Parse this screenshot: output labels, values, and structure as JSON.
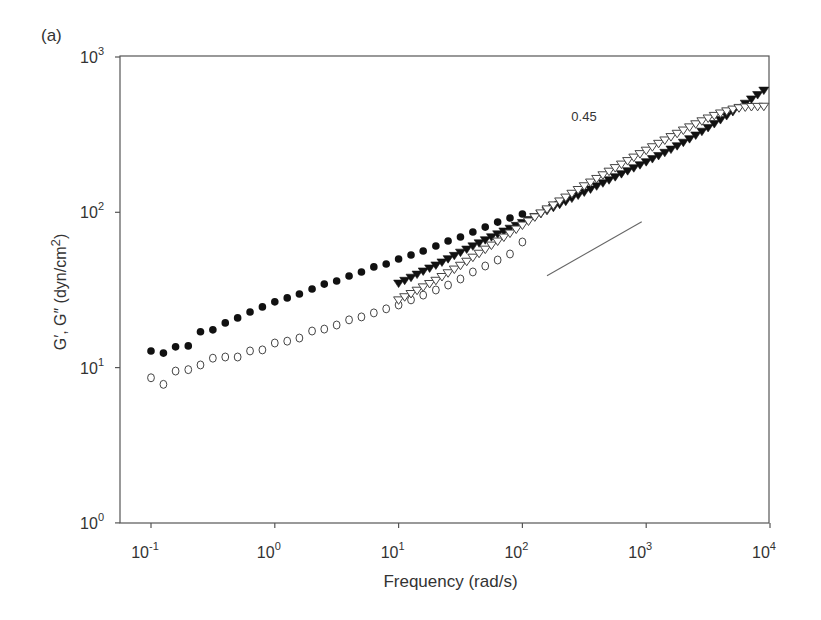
{
  "panel_label": "(a)",
  "chart_data": {
    "type": "scatter",
    "title": "",
    "panel": "(a)",
    "xlabel": "Frequency (rad/s)",
    "ylabel": "G′, G″ (dyn/cm2)",
    "xscale": "log",
    "yscale": "log",
    "xlim": [
      0.05,
      10000
    ],
    "ylim": [
      1,
      1000
    ],
    "grid": false,
    "legend": null,
    "x_ticks": [
      {
        "value": 0.1,
        "base": "10",
        "exp": "-1"
      },
      {
        "value": 1,
        "base": "10",
        "exp": "0"
      },
      {
        "value": 10,
        "base": "10",
        "exp": "1"
      },
      {
        "value": 100,
        "base": "10",
        "exp": "2"
      },
      {
        "value": 1000,
        "base": "10",
        "exp": "3"
      },
      {
        "value": 10000,
        "base": "10",
        "exp": "4"
      }
    ],
    "y_ticks": [
      {
        "value": 1,
        "base": "10",
        "exp": "0"
      },
      {
        "value": 10,
        "base": "10",
        "exp": "1"
      },
      {
        "value": 100,
        "base": "10",
        "exp": "2"
      },
      {
        "value": 1000,
        "base": "10",
        "exp": "3"
      }
    ],
    "annotations": [
      {
        "type": "slope-line",
        "label": "0.45",
        "x1": 158,
        "y1": 39,
        "x2": 920,
        "y2": 87
      }
    ],
    "series": [
      {
        "name": "G' (low-frequency, filled circles)",
        "marker": "filled-circle",
        "x": [
          0.1,
          0.126,
          0.158,
          0.2,
          0.251,
          0.316,
          0.398,
          0.501,
          0.631,
          0.794,
          1.0,
          1.26,
          1.58,
          2.0,
          2.51,
          3.16,
          3.98,
          5.01,
          6.31,
          7.94,
          10.0,
          12.6,
          15.8,
          20.0,
          25.1,
          31.6,
          39.8,
          50.1,
          63.1,
          79.4,
          100
        ],
        "y": [
          12.8,
          12.4,
          13.6,
          13.8,
          17.0,
          17.5,
          19.4,
          20.9,
          22.8,
          24.6,
          26.5,
          28.1,
          29.8,
          32.1,
          34.5,
          36.1,
          38.9,
          41.3,
          44.5,
          46.5,
          50.0,
          53.1,
          56.3,
          60.7,
          65.3,
          69.3,
          74.6,
          80.3,
          86.5,
          91.8,
          97.5
        ]
      },
      {
        "name": "G'' (low-frequency, open circles)",
        "marker": "open-circle",
        "x": [
          0.1,
          0.126,
          0.158,
          0.2,
          0.251,
          0.316,
          0.398,
          0.501,
          0.631,
          0.794,
          1.0,
          1.26,
          1.58,
          2.0,
          2.51,
          3.16,
          3.98,
          5.01,
          6.31,
          7.94,
          10.0,
          12.6,
          15.8,
          20.0,
          25.1,
          31.6,
          39.8,
          50.1,
          63.1,
          79.4,
          100
        ],
        "y": [
          8.6,
          7.8,
          9.5,
          9.7,
          10.4,
          11.5,
          11.7,
          11.7,
          12.8,
          13.0,
          14.4,
          14.8,
          15.5,
          17.2,
          17.7,
          18.8,
          20.3,
          21.2,
          22.5,
          23.9,
          25.3,
          27.3,
          29.3,
          31.6,
          34.0,
          37.2,
          41.3,
          45.1,
          49.3,
          53.9,
          64.4
        ]
      },
      {
        "name": "G' (high-frequency, filled triangles)",
        "marker": "filled-triangle-down",
        "x": [
          10.0,
          11.2,
          12.6,
          14.1,
          15.8,
          17.8,
          20.0,
          22.4,
          25.1,
          28.2,
          31.6,
          35.5,
          39.8,
          44.7,
          50.1,
          56.2,
          63.1,
          70.8,
          79.4,
          89.1,
          100,
          112,
          126,
          141,
          158,
          178,
          200,
          224,
          251,
          282,
          316,
          355,
          398,
          447,
          501,
          562,
          631,
          708,
          794,
          891,
          1000,
          1122,
          1259,
          1413,
          1585,
          1778,
          1995,
          2239,
          2512,
          2818,
          3162,
          3548,
          3981,
          4467,
          5012,
          5623,
          6310,
          7079,
          7943,
          8913
        ],
        "y": [
          35.0,
          36.5,
          38.2,
          40.0,
          41.9,
          43.8,
          45.8,
          47.9,
          50.3,
          52.8,
          55.4,
          58.0,
          60.8,
          63.6,
          66.6,
          69.6,
          72.7,
          75.8,
          79.0,
          82.4,
          86.0,
          89.9,
          94.0,
          98.3,
          102.9,
          107.7,
          112.7,
          117.9,
          123.4,
          129.1,
          135.1,
          141.4,
          148.0,
          154.9,
          162.0,
          169.6,
          177.4,
          185.4,
          193.7,
          202.6,
          211.9,
          221.8,
          232.2,
          243.4,
          255.4,
          268.5,
          282.7,
          298.1,
          314.7,
          332.8,
          352.0,
          372.9,
          395.5,
          419.8,
          445.6,
          473.7,
          504.3,
          537.2,
          573.0,
          612.0
        ]
      },
      {
        "name": "G'' (high-frequency, open triangles)",
        "marker": "open-triangle-down",
        "x": [
          10.0,
          11.2,
          12.6,
          14.1,
          15.8,
          17.8,
          20.0,
          22.4,
          25.1,
          28.2,
          31.6,
          35.5,
          39.8,
          44.7,
          50.1,
          56.2,
          63.1,
          70.8,
          79.4,
          89.1,
          100,
          112,
          126,
          141,
          158,
          178,
          200,
          224,
          251,
          282,
          316,
          355,
          398,
          447,
          501,
          562,
          631,
          708,
          794,
          891,
          1000,
          1122,
          1259,
          1413,
          1585,
          1778,
          1995,
          2239,
          2512,
          2818,
          3162,
          3548,
          3981,
          4467,
          5012,
          5623,
          6310,
          7079,
          7943,
          8913
        ],
        "y": [
          27.3,
          28.6,
          30.0,
          31.5,
          33.1,
          34.8,
          36.5,
          38.6,
          40.8,
          43.1,
          45.6,
          48.4,
          51.4,
          54.5,
          57.9,
          61.5,
          65.3,
          69.3,
          73.5,
          78.0,
          82.8,
          87.9,
          93.4,
          99.1,
          105.2,
          111.6,
          118.3,
          125.3,
          132.6,
          140.2,
          148.2,
          156.6,
          165.2,
          174.4,
          184.0,
          194.0,
          204.4,
          215.3,
          226.7,
          238.7,
          251.2,
          264.3,
          278.0,
          292.3,
          307.2,
          322.7,
          338.6,
          354.9,
          371.5,
          388.2,
          404.7,
          420.7,
          436.0,
          450.0,
          462.0,
          471.0,
          477.0,
          480.0,
          481.0,
          482.0
        ]
      }
    ]
  }
}
